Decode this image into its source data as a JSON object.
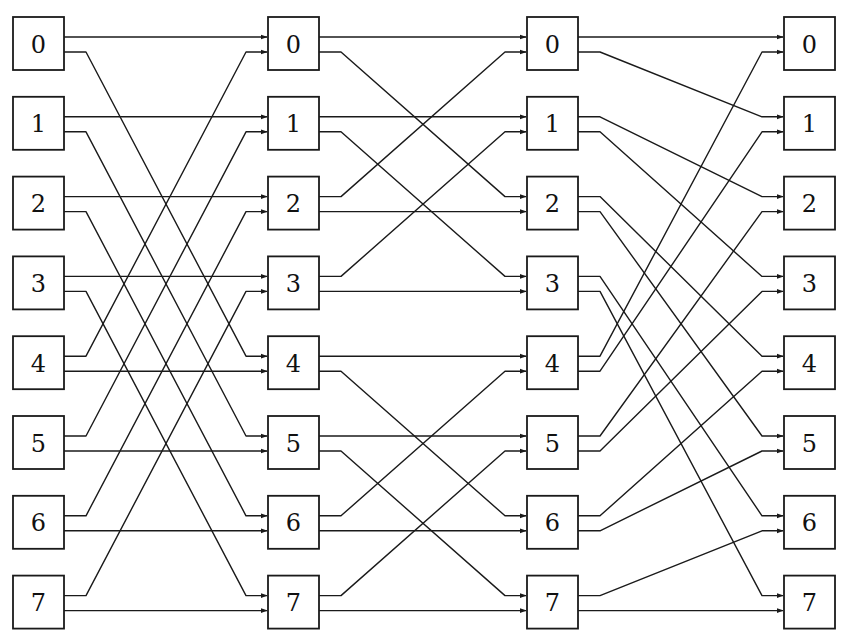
{
  "diagram": {
    "title": "",
    "type": "multistage-interconnection-network",
    "colors": {
      "stroke": "#1a1a1a",
      "background": "#ffffff",
      "text": "#111111"
    },
    "layout": {
      "box_width": 51,
      "box_height": 53,
      "row_top": 17,
      "row_pitch": 79.8,
      "port_upper_offset": 20,
      "port_lower_offset": 35,
      "bend_offset": 22
    },
    "columns": [
      {
        "name": "stage-0",
        "x": 13,
        "labels": [
          "0",
          "1",
          "2",
          "3",
          "4",
          "5",
          "6",
          "7"
        ]
      },
      {
        "name": "stage-1",
        "x": 268,
        "labels": [
          "0",
          "1",
          "2",
          "3",
          "4",
          "5",
          "6",
          "7"
        ]
      },
      {
        "name": "stage-2",
        "x": 527,
        "labels": [
          "0",
          "1",
          "2",
          "3",
          "4",
          "5",
          "6",
          "7"
        ]
      },
      {
        "name": "stage-3",
        "x": 784,
        "labels": [
          "0",
          "1",
          "2",
          "3",
          "4",
          "5",
          "6",
          "7"
        ]
      }
    ],
    "connections": [
      {
        "from_column": 0,
        "to_column": 1,
        "pattern": "butterfly-xor-4",
        "edges": [
          [
            0,
            0,
            "u",
            "u"
          ],
          [
            0,
            4,
            "l",
            "u"
          ],
          [
            1,
            1,
            "u",
            "u"
          ],
          [
            1,
            5,
            "l",
            "u"
          ],
          [
            2,
            2,
            "u",
            "u"
          ],
          [
            2,
            6,
            "l",
            "u"
          ],
          [
            3,
            3,
            "u",
            "u"
          ],
          [
            3,
            7,
            "l",
            "u"
          ],
          [
            4,
            0,
            "u",
            "l"
          ],
          [
            4,
            4,
            "l",
            "l"
          ],
          [
            5,
            1,
            "u",
            "l"
          ],
          [
            5,
            5,
            "l",
            "l"
          ],
          [
            6,
            2,
            "u",
            "l"
          ],
          [
            6,
            6,
            "l",
            "l"
          ],
          [
            7,
            3,
            "u",
            "l"
          ],
          [
            7,
            7,
            "l",
            "l"
          ]
        ]
      },
      {
        "from_column": 1,
        "to_column": 2,
        "pattern": "butterfly-xor-2",
        "edges": [
          [
            0,
            0,
            "u",
            "u"
          ],
          [
            0,
            2,
            "l",
            "u"
          ],
          [
            1,
            1,
            "u",
            "u"
          ],
          [
            1,
            3,
            "l",
            "u"
          ],
          [
            2,
            0,
            "u",
            "l"
          ],
          [
            2,
            2,
            "l",
            "l"
          ],
          [
            3,
            1,
            "u",
            "l"
          ],
          [
            3,
            3,
            "l",
            "l"
          ],
          [
            4,
            4,
            "u",
            "u"
          ],
          [
            4,
            6,
            "l",
            "u"
          ],
          [
            5,
            5,
            "u",
            "u"
          ],
          [
            5,
            7,
            "l",
            "u"
          ],
          [
            6,
            4,
            "u",
            "l"
          ],
          [
            6,
            6,
            "l",
            "l"
          ],
          [
            7,
            5,
            "u",
            "l"
          ],
          [
            7,
            7,
            "l",
            "l"
          ]
        ]
      },
      {
        "from_column": 2,
        "to_column": 3,
        "pattern": "perfect-shuffle",
        "edges": [
          [
            0,
            0,
            "u",
            "u"
          ],
          [
            0,
            1,
            "l",
            "u"
          ],
          [
            1,
            2,
            "u",
            "u"
          ],
          [
            1,
            3,
            "l",
            "u"
          ],
          [
            2,
            4,
            "u",
            "u"
          ],
          [
            2,
            5,
            "l",
            "u"
          ],
          [
            3,
            6,
            "u",
            "u"
          ],
          [
            3,
            7,
            "l",
            "u"
          ],
          [
            4,
            0,
            "u",
            "l"
          ],
          [
            4,
            1,
            "l",
            "l"
          ],
          [
            5,
            2,
            "u",
            "l"
          ],
          [
            5,
            3,
            "l",
            "l"
          ],
          [
            6,
            4,
            "u",
            "l"
          ],
          [
            6,
            5,
            "l",
            "l"
          ],
          [
            7,
            6,
            "u",
            "l"
          ],
          [
            7,
            7,
            "l",
            "l"
          ]
        ]
      }
    ]
  }
}
